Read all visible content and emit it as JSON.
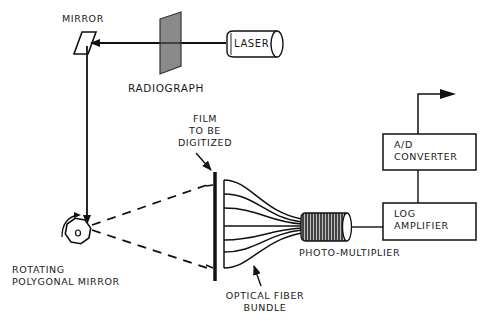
{
  "diagram": {
    "components": {
      "mirror": {
        "label": "MIRROR"
      },
      "radiograph": {
        "label": "RADIOGRAPH"
      },
      "laser": {
        "label": "LASER"
      },
      "film": {
        "label_lines": [
          "FILM",
          "TO BE",
          "DIGITIZED"
        ]
      },
      "polygonal_mirror": {
        "label_lines": [
          "ROTATING",
          "POLYGONAL MIRROR"
        ]
      },
      "fiber_bundle": {
        "label_lines": [
          "OPTICAL FIBER",
          "BUNDLE"
        ]
      },
      "photomultiplier": {
        "label": "PHOTO-MULTIPLIER"
      },
      "log_amplifier": {
        "label_lines": [
          "LOG",
          "AMPLIFIER"
        ]
      },
      "ad_converter": {
        "label_lines": [
          "A/D",
          "CONVERTER"
        ]
      }
    },
    "connections": [
      {
        "from": "laser",
        "to": "mirror",
        "via": "radiograph",
        "type": "beam-arrow"
      },
      {
        "from": "mirror",
        "to": "polygonal_mirror",
        "type": "beam-arrow"
      },
      {
        "from": "polygonal_mirror",
        "to": "film",
        "type": "dashed-scan"
      },
      {
        "from": "film",
        "to": "fiber_bundle",
        "type": "fibers"
      },
      {
        "from": "fiber_bundle",
        "to": "photomultiplier",
        "type": "fibers"
      },
      {
        "from": "photomultiplier",
        "to": "log_amplifier",
        "type": "line"
      },
      {
        "from": "log_amplifier",
        "to": "ad_converter",
        "type": "line"
      },
      {
        "from": "ad_converter",
        "to": "output",
        "type": "arrow"
      }
    ],
    "colors": {
      "ink": "#111111",
      "radiograph_fill": "#8a8a8a",
      "background": "#ffffff"
    }
  }
}
